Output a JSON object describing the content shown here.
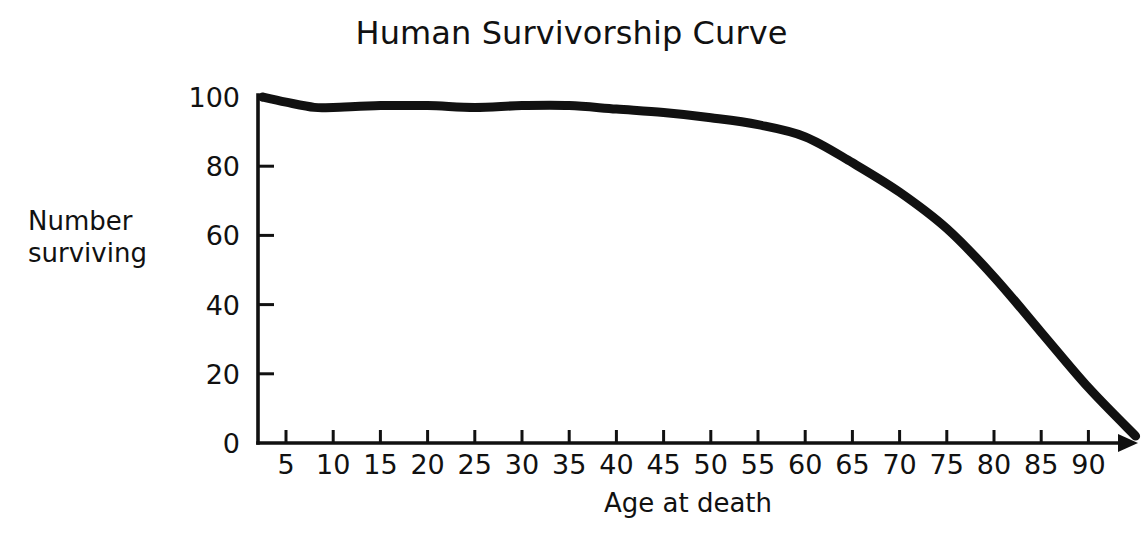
{
  "chart_data": {
    "type": "line",
    "title": "Human Survivorship Curve",
    "xlabel": "Age at death",
    "ylabel": "Number surviving",
    "ylabel_line1": "Number",
    "ylabel_line2": "surviving",
    "xlim": [
      2.5,
      95
    ],
    "ylim": [
      0,
      100
    ],
    "xticks": [
      5,
      10,
      15,
      20,
      25,
      30,
      35,
      40,
      45,
      50,
      55,
      60,
      65,
      70,
      75,
      80,
      85,
      90
    ],
    "yticks": [
      0,
      20,
      40,
      60,
      80,
      100
    ],
    "xtick_labels": [
      "5",
      "10",
      "15",
      "20",
      "25",
      "30",
      "35",
      "40",
      "45",
      "50",
      "55",
      "60",
      "65",
      "70",
      "75",
      "80",
      "85",
      "90"
    ],
    "ytick_labels": [
      "0",
      "20",
      "40",
      "60",
      "80",
      "100"
    ],
    "grid": false,
    "legend": "none",
    "series_name": "Survivorship",
    "line_color": "#111111",
    "x": [
      2.5,
      5,
      8,
      10,
      15,
      20,
      25,
      30,
      35,
      40,
      45,
      50,
      55,
      60,
      65,
      70,
      75,
      80,
      85,
      90,
      95
    ],
    "values": [
      100,
      98.5,
      97,
      97,
      97.5,
      97.5,
      97,
      97.5,
      97.5,
      96.5,
      95.5,
      94,
      92,
      88.5,
      81,
      72.5,
      62,
      48,
      32,
      16,
      2
    ],
    "annotations": [
      {
        "text": "curve begins at 100 at the y-axis and falls to near 0 just past age 90"
      }
    ]
  },
  "axes": {
    "arrow": "x-axis-arrow"
  }
}
